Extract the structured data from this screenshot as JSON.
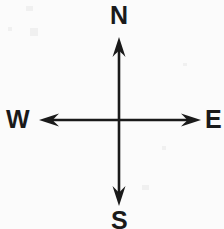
{
  "diagram": {
    "name": "cardinal-directions-compass",
    "background_color": "#fbfbfb",
    "stroke_color": "#1a1a1a",
    "center": {
      "x": 119,
      "y": 120
    },
    "labels": {
      "north": "N",
      "west": "W",
      "east": "E",
      "south": "S"
    },
    "axes": [
      {
        "id": "north-axis",
        "label": "N",
        "orientation": "vertical-up",
        "from": {
          "x": 119,
          "y": 120
        },
        "to": {
          "x": 119,
          "y": 38
        }
      },
      {
        "id": "south-axis",
        "label": "S",
        "orientation": "vertical-down",
        "from": {
          "x": 119,
          "y": 120
        },
        "to": {
          "x": 119,
          "y": 205
        }
      },
      {
        "id": "west-axis",
        "label": "W",
        "orientation": "horizontal-left",
        "from": {
          "x": 119,
          "y": 120
        },
        "to": {
          "x": 40,
          "y": 120
        }
      },
      {
        "id": "east-axis",
        "label": "E",
        "orientation": "horizontal-right",
        "from": {
          "x": 119,
          "y": 120
        },
        "to": {
          "x": 200,
          "y": 120
        }
      }
    ]
  }
}
